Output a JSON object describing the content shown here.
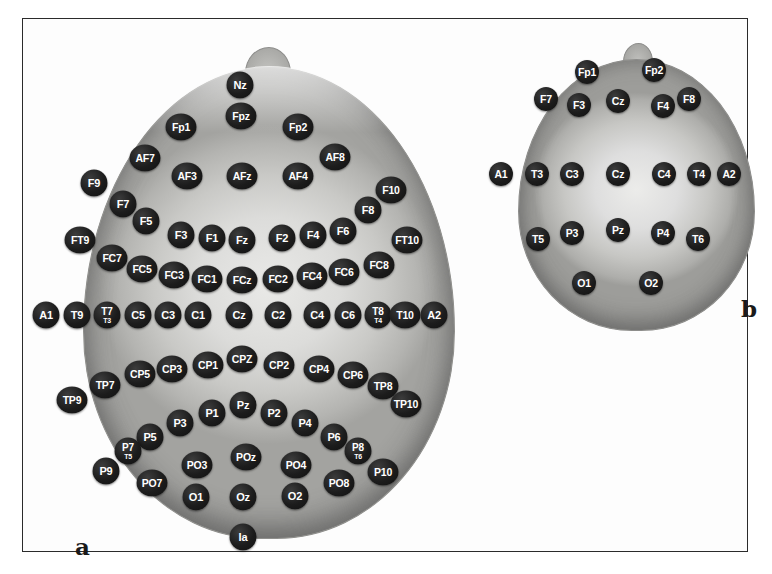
{
  "figure": {
    "panels": [
      {
        "id": "a",
        "letter": "a",
        "caption": "a",
        "system": "10-10 extended electrode placement (top view)"
      },
      {
        "id": "b",
        "letter": "b",
        "caption": "b",
        "system": "10-20 standard electrode placement (top view)"
      }
    ],
    "border_color": "#2b2b2b",
    "electrode_color": "#141414",
    "electrode_label_color": "#ffffff",
    "background_color": "#ffffff"
  },
  "panel_a": {
    "letter": "a",
    "electrodes": [
      {
        "label": "Nz",
        "sub": "",
        "x": 239,
        "y": 84,
        "cls": "e-a"
      },
      {
        "label": "Fpz",
        "sub": "",
        "x": 240,
        "y": 115,
        "cls": "e-a wide"
      },
      {
        "label": "Fp1",
        "sub": "",
        "x": 180,
        "y": 126,
        "cls": "e-a wide"
      },
      {
        "label": "Fp2",
        "sub": "",
        "x": 297,
        "y": 126,
        "cls": "e-a wide"
      },
      {
        "label": "AF7",
        "sub": "",
        "x": 144,
        "y": 157,
        "cls": "e-a wide"
      },
      {
        "label": "AF8",
        "sub": "",
        "x": 334,
        "y": 156,
        "cls": "e-a wide"
      },
      {
        "label": "AF3",
        "sub": "",
        "x": 186,
        "y": 175,
        "cls": "e-a wide"
      },
      {
        "label": "AFz",
        "sub": "",
        "x": 241,
        "y": 175,
        "cls": "e-a wide"
      },
      {
        "label": "AF4",
        "sub": "",
        "x": 297,
        "y": 175,
        "cls": "e-a wide"
      },
      {
        "label": "F9",
        "sub": "",
        "x": 93,
        "y": 182,
        "cls": "e-a"
      },
      {
        "label": "F10",
        "sub": "",
        "x": 390,
        "y": 189,
        "cls": "e-a wide"
      },
      {
        "label": "F7",
        "sub": "",
        "x": 122,
        "y": 203,
        "cls": "e-a"
      },
      {
        "label": "F8",
        "sub": "",
        "x": 367,
        "y": 209,
        "cls": "e-a"
      },
      {
        "label": "F5",
        "sub": "",
        "x": 145,
        "y": 220,
        "cls": "e-a"
      },
      {
        "label": "F6",
        "sub": "",
        "x": 342,
        "y": 230,
        "cls": "e-a"
      },
      {
        "label": "F3",
        "sub": "",
        "x": 180,
        "y": 234,
        "cls": "e-a"
      },
      {
        "label": "F4",
        "sub": "",
        "x": 312,
        "y": 234,
        "cls": "e-a"
      },
      {
        "label": "F1",
        "sub": "",
        "x": 211,
        "y": 237,
        "cls": "e-a"
      },
      {
        "label": "F2",
        "sub": "",
        "x": 281,
        "y": 237,
        "cls": "e-a"
      },
      {
        "label": "Fz",
        "sub": "",
        "x": 241,
        "y": 239,
        "cls": "e-a"
      },
      {
        "label": "FT9",
        "sub": "",
        "x": 79,
        "y": 239,
        "cls": "e-a wide"
      },
      {
        "label": "FT10",
        "sub": "",
        "x": 406,
        "y": 239,
        "cls": "e-a wide"
      },
      {
        "label": "FC7",
        "sub": "",
        "x": 111,
        "y": 257,
        "cls": "e-a wide"
      },
      {
        "label": "FC8",
        "sub": "",
        "x": 378,
        "y": 264,
        "cls": "e-a wide"
      },
      {
        "label": "FC5",
        "sub": "",
        "x": 141,
        "y": 268,
        "cls": "e-a wide"
      },
      {
        "label": "FC6",
        "sub": "",
        "x": 343,
        "y": 271,
        "cls": "e-a wide"
      },
      {
        "label": "FC3",
        "sub": "",
        "x": 173,
        "y": 274,
        "cls": "e-a wide"
      },
      {
        "label": "FC4",
        "sub": "",
        "x": 311,
        "y": 275,
        "cls": "e-a wide"
      },
      {
        "label": "FC1",
        "sub": "",
        "x": 206,
        "y": 278,
        "cls": "e-a wide"
      },
      {
        "label": "FCz",
        "sub": "",
        "x": 241,
        "y": 279,
        "cls": "e-a wide"
      },
      {
        "label": "FC2",
        "sub": "",
        "x": 277,
        "y": 278,
        "cls": "e-a wide"
      },
      {
        "label": "A1",
        "sub": "",
        "x": 45,
        "y": 314,
        "cls": "e-a"
      },
      {
        "label": "T9",
        "sub": "",
        "x": 76,
        "y": 314,
        "cls": "e-a"
      },
      {
        "label": "T7",
        "sub": "T3",
        "x": 106,
        "y": 314,
        "cls": "e-a dual"
      },
      {
        "label": "C5",
        "sub": "",
        "x": 137,
        "y": 314,
        "cls": "e-a"
      },
      {
        "label": "C3",
        "sub": "",
        "x": 167,
        "y": 314,
        "cls": "e-a"
      },
      {
        "label": "C1",
        "sub": "",
        "x": 197,
        "y": 314,
        "cls": "e-a"
      },
      {
        "label": "Cz",
        "sub": "",
        "x": 238,
        "y": 314,
        "cls": "e-a"
      },
      {
        "label": "C2",
        "sub": "",
        "x": 277,
        "y": 314,
        "cls": "e-a"
      },
      {
        "label": "C4",
        "sub": "",
        "x": 316,
        "y": 314,
        "cls": "e-a"
      },
      {
        "label": "C6",
        "sub": "",
        "x": 347,
        "y": 314,
        "cls": "e-a"
      },
      {
        "label": "T8",
        "sub": "T4",
        "x": 377,
        "y": 314,
        "cls": "e-a dual"
      },
      {
        "label": "T10",
        "sub": "",
        "x": 404,
        "y": 314,
        "cls": "e-a wide"
      },
      {
        "label": "A2",
        "sub": "",
        "x": 433,
        "y": 314,
        "cls": "e-a"
      },
      {
        "label": "CPZ",
        "sub": "",
        "x": 241,
        "y": 358,
        "cls": "e-a wide"
      },
      {
        "label": "CP1",
        "sub": "",
        "x": 207,
        "y": 364,
        "cls": "e-a wide"
      },
      {
        "label": "CP2",
        "sub": "",
        "x": 278,
        "y": 364,
        "cls": "e-a wide"
      },
      {
        "label": "CP3",
        "sub": "",
        "x": 171,
        "y": 368,
        "cls": "e-a wide"
      },
      {
        "label": "CP4",
        "sub": "",
        "x": 318,
        "y": 368,
        "cls": "e-a wide"
      },
      {
        "label": "CP5",
        "sub": "",
        "x": 139,
        "y": 373,
        "cls": "e-a wide"
      },
      {
        "label": "CP6",
        "sub": "",
        "x": 352,
        "y": 374,
        "cls": "e-a wide"
      },
      {
        "label": "TP7",
        "sub": "",
        "x": 104,
        "y": 384,
        "cls": "e-a wide"
      },
      {
        "label": "TP8",
        "sub": "",
        "x": 382,
        "y": 385,
        "cls": "e-a wide"
      },
      {
        "label": "TP9",
        "sub": "",
        "x": 71,
        "y": 399,
        "cls": "e-a wide"
      },
      {
        "label": "TP10",
        "sub": "",
        "x": 405,
        "y": 403,
        "cls": "e-a wide"
      },
      {
        "label": "Pz",
        "sub": "",
        "x": 242,
        "y": 404,
        "cls": "e-a"
      },
      {
        "label": "P1",
        "sub": "",
        "x": 211,
        "y": 412,
        "cls": "e-a"
      },
      {
        "label": "P2",
        "sub": "",
        "x": 273,
        "y": 412,
        "cls": "e-a"
      },
      {
        "label": "P3",
        "sub": "",
        "x": 179,
        "y": 422,
        "cls": "e-a"
      },
      {
        "label": "P4",
        "sub": "",
        "x": 304,
        "y": 422,
        "cls": "e-a"
      },
      {
        "label": "P5",
        "sub": "",
        "x": 149,
        "y": 436,
        "cls": "e-a"
      },
      {
        "label": "P6",
        "sub": "",
        "x": 333,
        "y": 436,
        "cls": "e-a"
      },
      {
        "label": "P7",
        "sub": "T5",
        "x": 127,
        "y": 450,
        "cls": "e-a dual"
      },
      {
        "label": "P8",
        "sub": "T6",
        "x": 357,
        "y": 450,
        "cls": "e-a dual"
      },
      {
        "label": "POz",
        "sub": "",
        "x": 245,
        "y": 456,
        "cls": "e-a wide"
      },
      {
        "label": "PO3",
        "sub": "",
        "x": 196,
        "y": 464,
        "cls": "e-a wide"
      },
      {
        "label": "PO4",
        "sub": "",
        "x": 295,
        "y": 464,
        "cls": "e-a wide"
      },
      {
        "label": "P9",
        "sub": "",
        "x": 105,
        "y": 470,
        "cls": "e-a"
      },
      {
        "label": "P10",
        "sub": "",
        "x": 382,
        "y": 471,
        "cls": "e-a wide"
      },
      {
        "label": "PO7",
        "sub": "",
        "x": 151,
        "y": 482,
        "cls": "e-a wide"
      },
      {
        "label": "PO8",
        "sub": "",
        "x": 338,
        "y": 482,
        "cls": "e-a wide"
      },
      {
        "label": "O1",
        "sub": "",
        "x": 195,
        "y": 496,
        "cls": "e-a"
      },
      {
        "label": "Oz",
        "sub": "",
        "x": 242,
        "y": 496,
        "cls": "e-a"
      },
      {
        "label": "O2",
        "sub": "",
        "x": 294,
        "y": 495,
        "cls": "e-a"
      },
      {
        "label": "Ia",
        "sub": "",
        "x": 242,
        "y": 536,
        "cls": "e-a"
      }
    ]
  },
  "panel_b": {
    "letter": "b",
    "electrodes": [
      {
        "label": "Fp1",
        "x": 586,
        "y": 71,
        "cls": "e-b"
      },
      {
        "label": "Fp2",
        "x": 653,
        "y": 69,
        "cls": "e-b"
      },
      {
        "label": "F7",
        "x": 545,
        "y": 98,
        "cls": "e-b"
      },
      {
        "label": "F8",
        "x": 688,
        "y": 98,
        "cls": "e-b"
      },
      {
        "label": "F3",
        "x": 578,
        "y": 104,
        "cls": "e-b"
      },
      {
        "label": "Cz",
        "x": 617,
        "y": 100,
        "cls": "e-b"
      },
      {
        "label": "F4",
        "x": 662,
        "y": 105,
        "cls": "e-b"
      },
      {
        "label": "A1",
        "x": 500,
        "y": 173,
        "cls": "e-b"
      },
      {
        "label": "T3",
        "x": 536,
        "y": 173,
        "cls": "e-b"
      },
      {
        "label": "C3",
        "x": 571,
        "y": 173,
        "cls": "e-b"
      },
      {
        "label": "Cz",
        "x": 617,
        "y": 173,
        "cls": "e-b"
      },
      {
        "label": "C4",
        "x": 663,
        "y": 173,
        "cls": "e-b"
      },
      {
        "label": "T4",
        "x": 698,
        "y": 173,
        "cls": "e-b"
      },
      {
        "label": "A2",
        "x": 728,
        "y": 173,
        "cls": "e-b"
      },
      {
        "label": "T5",
        "x": 537,
        "y": 238,
        "cls": "e-b"
      },
      {
        "label": "P3",
        "x": 571,
        "y": 232,
        "cls": "e-b"
      },
      {
        "label": "Pz",
        "x": 617,
        "y": 229,
        "cls": "e-b"
      },
      {
        "label": "P4",
        "x": 662,
        "y": 232,
        "cls": "e-b"
      },
      {
        "label": "T6",
        "x": 697,
        "y": 238,
        "cls": "e-b"
      },
      {
        "label": "O1",
        "x": 583,
        "y": 282,
        "cls": "e-b"
      },
      {
        "label": "O2",
        "x": 650,
        "y": 282,
        "cls": "e-b"
      }
    ]
  }
}
